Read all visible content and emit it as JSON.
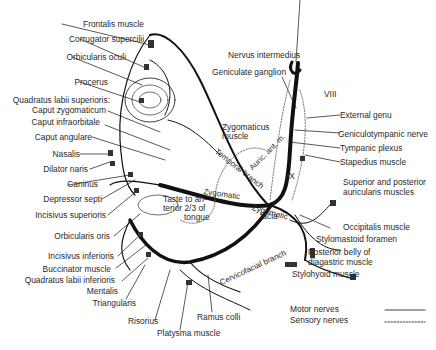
{
  "diagram": {
    "left_labels": [
      {
        "id": "frontalis",
        "text": "Frontalis muscle"
      },
      {
        "id": "corrugator",
        "text": "Corrugator supercilii"
      },
      {
        "id": "orbicularis_oculi",
        "text": "Orbicularis oculi"
      },
      {
        "id": "procerus",
        "text": "Procerus"
      },
      {
        "id": "quadratus_sup",
        "text": "Quadratus labii superioris:"
      },
      {
        "id": "caput_zyg",
        "text": "Caput zygomaticum"
      },
      {
        "id": "caput_infra",
        "text": "Caput infraorbitale"
      },
      {
        "id": "caput_ang",
        "text": "Caput angulare"
      },
      {
        "id": "nasalis",
        "text": "Nasalis"
      },
      {
        "id": "dilator",
        "text": "Dilator naris"
      },
      {
        "id": "caninus",
        "text": "Caninus"
      },
      {
        "id": "depressor",
        "text": "Depressor septi"
      },
      {
        "id": "incisivus_sup",
        "text": "Incisivus superioris"
      },
      {
        "id": "orbicularis_oris",
        "text": "Orbicularis oris"
      },
      {
        "id": "incisivus_inf",
        "text": "Incisivus inferioris"
      },
      {
        "id": "buccinator",
        "text": "Buccinator muscle"
      },
      {
        "id": "quadratus_inf",
        "text": "Quadratus labii inferioris"
      },
      {
        "id": "mentalis",
        "text": "Mentalis"
      },
      {
        "id": "triangularis",
        "text": "Triangularis"
      }
    ],
    "bottom_labels": [
      {
        "id": "risorius",
        "text": "Risorius"
      },
      {
        "id": "platysma",
        "text": "Platysma muscle"
      },
      {
        "id": "ramus_colli",
        "text": "Ramus colli"
      }
    ],
    "right_labels": [
      {
        "id": "nervus_intermedius",
        "text": "Nervus intermedius"
      },
      {
        "id": "geniculate",
        "text": "Geniculate ganglion"
      },
      {
        "id": "viii",
        "text": "VIII"
      },
      {
        "id": "external_genu",
        "text": "External genu"
      },
      {
        "id": "geniculotympanic",
        "text": "Geniculotympanic nerve"
      },
      {
        "id": "tympanic",
        "text": "Tympanic plexus"
      },
      {
        "id": "stapedius",
        "text": "Stapedius muscle"
      },
      {
        "id": "sup_post_1",
        "text": "Superior and posterior"
      },
      {
        "id": "sup_post_2",
        "text": "auricularis muscles"
      },
      {
        "id": "occipitalis",
        "text": "Occipitalis muscle"
      },
      {
        "id": "stylomastoid",
        "text": "Stylomastoid foramen"
      },
      {
        "id": "post_belly_1",
        "text": "Posterior belly of"
      },
      {
        "id": "post_belly_2",
        "text": "diagastric muscle"
      },
      {
        "id": "stylohyoid",
        "text": "Stylohyoid muscle"
      }
    ],
    "inner_labels": {
      "zygomaticus_1": "Zygomaticus",
      "zygomaticus_2": "muscle",
      "temporal_branch": "Temporal branch",
      "auric_ant": "Auric. ant. m.",
      "ix": "IX",
      "zygomatic": "Zygomatic",
      "zygomatic_facia_1": "Zygomatic",
      "zygomatic_facia_2": "facia",
      "taste_1": "Taste to an-",
      "taste_2": "terior  2/3 of",
      "taste_3": "tongue",
      "cervicofacial": "Cervicofacial branch"
    },
    "legend": [
      {
        "style": "solid",
        "label": "Motor nerves"
      },
      {
        "style": "dotted",
        "label": "Sensory nerves"
      }
    ]
  }
}
